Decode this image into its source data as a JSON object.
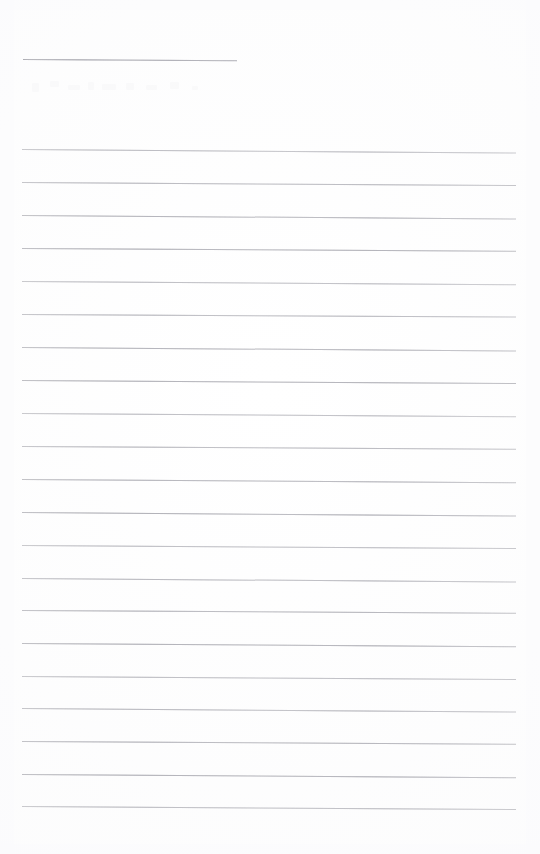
{
  "document": {
    "kind": "scanned-lined-notebook-page",
    "title": "Blank Ruled Notepad Page",
    "page_width": 540,
    "page_height": 854,
    "background_color": "#ffffff",
    "rule_color": "#bcbcc1",
    "rule_accent_color": "#a9a9b0",
    "content_text": "",
    "written_text_present": "none"
  },
  "layout": {
    "left_margin_x": 22,
    "right_margin_x": 516,
    "rule_spacing_px": 32.8,
    "first_rule_y": 59,
    "body_first_rule_y": 149,
    "body_last_rule_y": 806,
    "bottom_blank_height": 48
  },
  "header_rule": {
    "label": "short header rule",
    "x": 23,
    "y": 59,
    "width": 214,
    "skew_deg": 0.35
  },
  "rules": [
    {
      "y": 149,
      "x": 22,
      "width": 494,
      "skew_deg": 0.42
    },
    {
      "y": 182,
      "x": 22,
      "width": 494,
      "skew_deg": 0.36
    },
    {
      "y": 215,
      "x": 22,
      "width": 494,
      "skew_deg": 0.4
    },
    {
      "y": 248,
      "x": 22,
      "width": 494,
      "skew_deg": 0.33
    },
    {
      "y": 281,
      "x": 22,
      "width": 494,
      "skew_deg": 0.38
    },
    {
      "y": 314,
      "x": 22,
      "width": 494,
      "skew_deg": 0.3
    },
    {
      "y": 347,
      "x": 22,
      "width": 494,
      "skew_deg": 0.4
    },
    {
      "y": 380,
      "x": 22,
      "width": 494,
      "skew_deg": 0.34
    },
    {
      "y": 413,
      "x": 22,
      "width": 494,
      "skew_deg": 0.39
    },
    {
      "y": 446,
      "x": 22,
      "width": 494,
      "skew_deg": 0.31
    },
    {
      "y": 479,
      "x": 22,
      "width": 494,
      "skew_deg": 0.37
    },
    {
      "y": 512,
      "x": 22,
      "width": 494,
      "skew_deg": 0.42
    },
    {
      "y": 545,
      "x": 22,
      "width": 494,
      "skew_deg": 0.35
    },
    {
      "y": 578,
      "x": 22,
      "width": 494,
      "skew_deg": 0.4
    },
    {
      "y": 610,
      "x": 22,
      "width": 494,
      "skew_deg": 0.32
    },
    {
      "y": 643,
      "x": 22,
      "width": 494,
      "skew_deg": 0.38
    },
    {
      "y": 676,
      "x": 22,
      "width": 494,
      "skew_deg": 0.36
    },
    {
      "y": 708,
      "x": 22,
      "width": 494,
      "skew_deg": 0.41
    },
    {
      "y": 741,
      "x": 22,
      "width": 494,
      "skew_deg": 0.33
    },
    {
      "y": 774,
      "x": 22,
      "width": 494,
      "skew_deg": 0.39
    },
    {
      "y": 806,
      "x": 22,
      "width": 494,
      "skew_deg": 0.35
    }
  ],
  "artifacts": {
    "ghost_marks_label": "faint scan ghosting",
    "ghost_marks": [
      {
        "left": 2,
        "top": 3,
        "width": 7,
        "height": 9
      },
      {
        "left": 20,
        "top": 1,
        "width": 9,
        "height": 6
      },
      {
        "left": 38,
        "top": 5,
        "width": 12,
        "height": 5
      },
      {
        "left": 58,
        "top": 2,
        "width": 6,
        "height": 8
      },
      {
        "left": 72,
        "top": 4,
        "width": 14,
        "height": 6
      },
      {
        "left": 96,
        "top": 3,
        "width": 8,
        "height": 7
      },
      {
        "left": 116,
        "top": 5,
        "width": 11,
        "height": 5
      },
      {
        "left": 140,
        "top": 2,
        "width": 9,
        "height": 7
      },
      {
        "left": 162,
        "top": 6,
        "width": 6,
        "height": 4
      }
    ],
    "corner_noise": [
      {
        "left": 0,
        "top": 0,
        "width": 540,
        "height": 10
      },
      {
        "left": 0,
        "top": 0,
        "width": 14,
        "height": 854
      },
      {
        "left": 526,
        "top": 0,
        "width": 14,
        "height": 854
      },
      {
        "left": 0,
        "top": 844,
        "width": 540,
        "height": 10
      }
    ]
  }
}
